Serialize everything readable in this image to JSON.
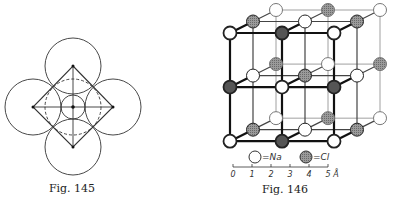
{
  "figures": [
    {
      "id": "fig145",
      "caption": "Fig. 145",
      "description": "Four large touching circles around a central small circle, with an inscribed diamond, cross lines and a dashed circle"
    },
    {
      "id": "fig146",
      "caption": "Fig. 146",
      "description": "NaCl rock-salt crystal lattice, 3x3x3 nodes",
      "legend": [
        {
          "symbol": "white-circle",
          "label": "=Na"
        },
        {
          "symbol": "gray-circle",
          "label": "=Cl"
        }
      ],
      "scale": {
        "ticks": [
          "0",
          "1",
          "2",
          "3",
          "4",
          "5"
        ],
        "unit": "Å"
      }
    }
  ]
}
